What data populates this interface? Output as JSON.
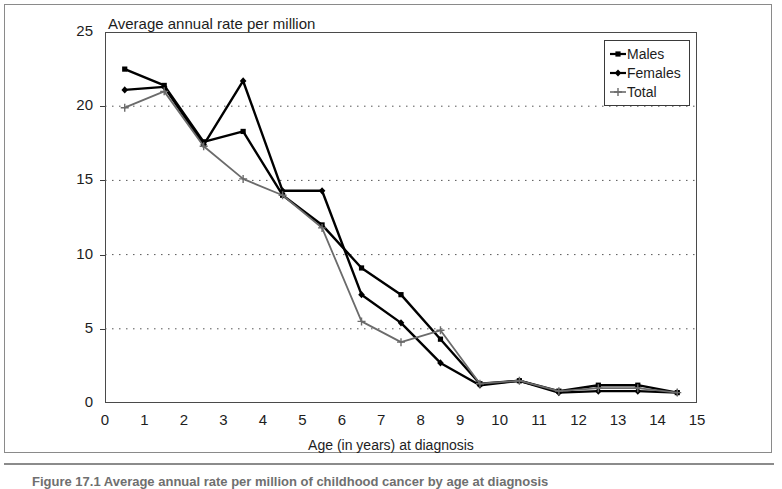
{
  "figure": {
    "caption": "Figure 17.1  Average annual rate per million of childhood cancer by age at diagnosis"
  },
  "chart_data": {
    "type": "line",
    "title": "Average annual rate per million",
    "xlabel": "Age (in years) at diagnosis",
    "ylabel": "",
    "xlim": [
      0,
      15
    ],
    "ylim": [
      0,
      25
    ],
    "xticks": [
      "0",
      "1",
      "2",
      "3",
      "4",
      "5",
      "6",
      "7",
      "8",
      "9",
      "10",
      "11",
      "12",
      "13",
      "14",
      "15"
    ],
    "yticks": [
      "0",
      "5",
      "10",
      "15",
      "20",
      "25"
    ],
    "grid": "horizontal-dotted",
    "legend_position": "top-right",
    "x": [
      0.5,
      1.5,
      2.5,
      3.5,
      4.5,
      5.5,
      6.5,
      7.5,
      8.5,
      9.5,
      10.5,
      11.5,
      12.5,
      13.5,
      14.5
    ],
    "series": [
      {
        "name": "Males",
        "marker": "square",
        "color": "#000000",
        "values": [
          22.5,
          21.4,
          17.6,
          18.3,
          14.0,
          12.0,
          9.1,
          7.3,
          4.3,
          1.3,
          1.5,
          0.8,
          1.2,
          1.2,
          0.7
        ]
      },
      {
        "name": "Females",
        "marker": "diamond",
        "color": "#000000",
        "values": [
          21.1,
          21.3,
          17.4,
          21.7,
          14.3,
          14.3,
          7.3,
          5.4,
          2.7,
          1.2,
          1.5,
          0.7,
          0.8,
          0.8,
          0.7
        ]
      },
      {
        "name": "Total",
        "marker": "cross",
        "color": "#6b6b6b",
        "values": [
          19.9,
          21.0,
          17.3,
          15.1,
          14.0,
          11.8,
          5.5,
          4.1,
          4.9,
          1.3,
          1.5,
          0.8,
          1.0,
          1.0,
          0.7
        ]
      }
    ]
  },
  "legend": {
    "items": [
      {
        "label": "Males"
      },
      {
        "label": "Females"
      },
      {
        "label": "Total"
      }
    ]
  }
}
